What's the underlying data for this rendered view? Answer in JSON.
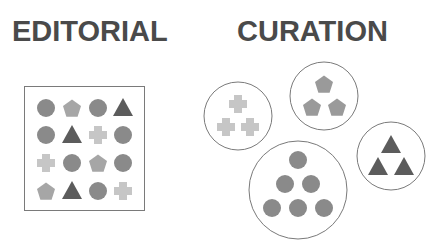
{
  "titles": {
    "left": "EDITORIAL",
    "right": "CURATION"
  },
  "colors": {
    "circle": "#8a8a8a",
    "pentagon": "#a6a6a6",
    "pentagon_curated": "#9a9a9a",
    "triangle": "#5c5c5c",
    "cross": "#c6c6c6",
    "outline": "#7a7a7a",
    "title": "#4a4a4a"
  },
  "editorial_grid": {
    "box": {
      "x": 24,
      "y": 86,
      "w": 120,
      "h": 124
    },
    "columns": [
      46,
      72,
      98,
      123
    ],
    "rows": [
      108,
      135,
      163,
      191
    ],
    "cells": [
      [
        "circle",
        "pentagon",
        "circle",
        "triangle"
      ],
      [
        "circle",
        "triangle",
        "cross",
        "circle"
      ],
      [
        "cross",
        "circle",
        "pentagon",
        "circle"
      ],
      [
        "pentagon",
        "triangle",
        "circle",
        "cross"
      ]
    ]
  },
  "curation_groups": [
    {
      "name": "crosses",
      "shape": "cross",
      "cx": 238,
      "cy": 116,
      "r": 34,
      "items": [
        [
          238,
          104
        ],
        [
          226,
          127
        ],
        [
          250,
          127
        ]
      ]
    },
    {
      "name": "pentagons",
      "shape": "pentagon",
      "cx": 324,
      "cy": 96,
      "r": 34,
      "items": [
        [
          324,
          84
        ],
        [
          312,
          107
        ],
        [
          337,
          107
        ]
      ]
    },
    {
      "name": "triangles",
      "shape": "triangle",
      "cx": 391,
      "cy": 156,
      "r": 34,
      "items": [
        [
          391,
          145
        ],
        [
          378,
          167
        ],
        [
          404,
          167
        ]
      ]
    },
    {
      "name": "circles",
      "shape": "circle",
      "cx": 298,
      "cy": 190,
      "r": 49,
      "items": [
        [
          298,
          160
        ],
        [
          285,
          184
        ],
        [
          311,
          184
        ],
        [
          272,
          208
        ],
        [
          298,
          208
        ],
        [
          324,
          208
        ]
      ]
    }
  ]
}
